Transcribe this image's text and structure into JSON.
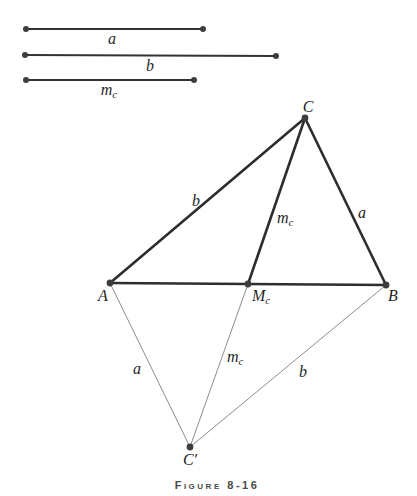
{
  "figure": {
    "caption": "Figure 8-16"
  },
  "colors": {
    "background": "#ffffff",
    "segment_line": "#333333",
    "thick_line": "#2d2d2d",
    "thin_line": "#8c8c8c",
    "dot": "#3d3d3d",
    "label_text": "#1f1f1f",
    "caption_text": "#4a4a4a"
  },
  "given_segments": [
    {
      "name": "segment-a",
      "main": "a",
      "sub": ""
    },
    {
      "name": "segment-b",
      "main": "b",
      "sub": ""
    },
    {
      "name": "segment-mc",
      "main": "m",
      "sub": "c"
    }
  ],
  "vertices": [
    {
      "name": "C",
      "main": "C",
      "sub": ""
    },
    {
      "name": "A",
      "main": "A",
      "sub": ""
    },
    {
      "name": "M_c",
      "main": "M",
      "sub": "c"
    },
    {
      "name": "B",
      "main": "B",
      "sub": ""
    },
    {
      "name": "C_prime",
      "main": "C′",
      "sub": ""
    }
  ],
  "side_labels": [
    {
      "name": "AC",
      "main": "b",
      "sub": ""
    },
    {
      "name": "C-Mc-median",
      "main": "m",
      "sub": "c"
    },
    {
      "name": "CB",
      "main": "a",
      "sub": ""
    },
    {
      "name": "A-Cprime",
      "main": "a",
      "sub": ""
    },
    {
      "name": "Mc-Cprime",
      "main": "m",
      "sub": "c"
    },
    {
      "name": "B-Cprime",
      "main": "b",
      "sub": ""
    }
  ]
}
